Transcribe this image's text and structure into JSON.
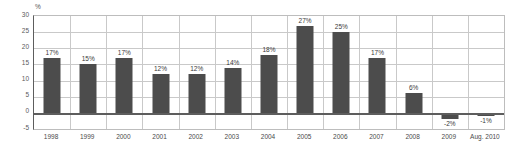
{
  "chart_data": {
    "type": "bar",
    "title": "",
    "xlabel": "",
    "ylabel": "%",
    "unit_label": "%",
    "categories": [
      "1998",
      "1999",
      "2000",
      "2001",
      "2002",
      "2003",
      "2004",
      "2005",
      "2006",
      "2007",
      "2008",
      "2009",
      "Aug. 2010"
    ],
    "values": [
      17,
      15,
      17,
      12,
      12,
      14,
      18,
      27,
      25,
      17,
      6,
      -2,
      -1
    ],
    "value_labels": [
      "17%",
      "15%",
      "17%",
      "12%",
      "12%",
      "14%",
      "18%",
      "27%",
      "25%",
      "17%",
      "6%",
      "-2%",
      "-1%"
    ],
    "ylim": [
      -5,
      30
    ],
    "yticks": [
      30,
      25,
      20,
      15,
      10,
      5,
      0,
      -5
    ],
    "ytick_labels": [
      "30",
      "25",
      "20",
      "15",
      "10",
      "5",
      "0",
      "-5"
    ],
    "grid": true,
    "grid_horizontal": true,
    "grid_vertical": true,
    "legend": null,
    "legend_position": "none",
    "bar_color": "#4c4c4c",
    "axis_color": "#5d5d5d",
    "grid_color": "#c9c9c9",
    "label_color": "#3a3a3a"
  }
}
